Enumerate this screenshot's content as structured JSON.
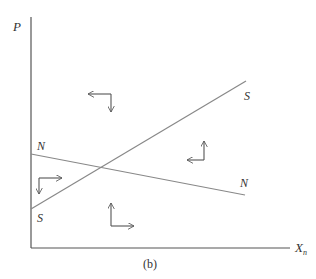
{
  "figure": {
    "caption": "(b)",
    "axes": {
      "y_label": "P",
      "x_label_main": "X",
      "x_label_sub": "n",
      "origin": [
        31,
        248
      ],
      "y_top": [
        31,
        17
      ],
      "x_end": [
        290,
        248
      ],
      "color": "#555555"
    },
    "lines": [
      {
        "name": "S",
        "from": [
          31,
          209
        ],
        "to": [
          246,
          81
        ],
        "label_start": "S",
        "label_end": "S",
        "color": "#888888"
      },
      {
        "name": "N",
        "from": [
          31,
          154
        ],
        "to": [
          245,
          195
        ],
        "label_start": "N",
        "label_end": "N",
        "color": "#888888"
      }
    ],
    "labels": {
      "s_upper": "S",
      "s_lower": "S",
      "n_upper": "N",
      "n_right": "N"
    },
    "regions": [
      {
        "name": "upper-region",
        "arrows": [
          "left",
          "down"
        ]
      },
      {
        "name": "left-region",
        "arrows": [
          "down",
          "right"
        ]
      },
      {
        "name": "lower-region",
        "arrows": [
          "up",
          "right"
        ]
      },
      {
        "name": "right-region",
        "arrows": [
          "up",
          "left"
        ]
      }
    ],
    "arrow_color": "#555555"
  }
}
